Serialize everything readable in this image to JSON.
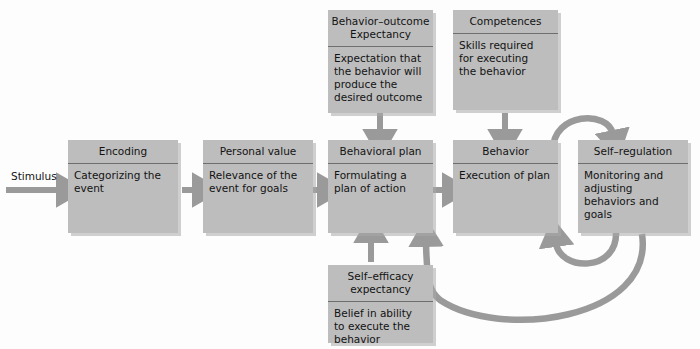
{
  "diagram": {
    "title_text": "Social cognitive process model",
    "colors": {
      "box_fill": "#bdbdbd",
      "box_divider": "#6e6e6e",
      "arrow": "#9a9a9a",
      "text": "#131313",
      "background": "#fdfdfd"
    },
    "entry_label": "Stimulus",
    "boxes": [
      {
        "id": "encoding",
        "head": "Encoding",
        "body": "Categorizing the\nevent"
      },
      {
        "id": "personal-value",
        "head": "Personal value",
        "body": "Relevance of  the\nevent for goals"
      },
      {
        "id": "behavioral-plan",
        "head": "Behavioral plan",
        "body": "Formulating a\nplan of action"
      },
      {
        "id": "behavior",
        "head": "Behavior",
        "body": "Execution of plan"
      },
      {
        "id": "self-regulation",
        "head": "Self–regulation",
        "body": "Monitoring and\nadjusting\nbehaviors and\ngoals"
      },
      {
        "id": "behavior-outcome-expectancy",
        "head": "Behavior–outcome\nExpectancy",
        "body": "Expectation that\nthe behavior will\nproduce the\ndesired outcome"
      },
      {
        "id": "competences",
        "head": "Competences",
        "body": "Skills required\nfor executing\nthe behavior"
      },
      {
        "id": "self-efficacy-expectancy",
        "head": "Self–efficacy\nexpectancy",
        "body": "Belief in ability\nto execute the\nbehavior"
      }
    ],
    "connections": [
      {
        "id": "stimulus-to-encoding",
        "kind": "straight-right"
      },
      {
        "id": "encoding-to-personal-value",
        "kind": "straight-right"
      },
      {
        "id": "personal-value-to-behavioral-plan",
        "kind": "straight-right"
      },
      {
        "id": "behavioral-plan-to-behavior",
        "kind": "straight-right"
      },
      {
        "id": "expectancy-to-behavioral-plan",
        "kind": "straight-down"
      },
      {
        "id": "competences-to-behavior",
        "kind": "straight-down"
      },
      {
        "id": "self-efficacy-to-behavioral-plan",
        "kind": "straight-up"
      },
      {
        "id": "behavior-to-self-regulation",
        "kind": "curve-over-top"
      },
      {
        "id": "self-regulation-to-behavior",
        "kind": "curve-under-small"
      },
      {
        "id": "self-regulation-to-behavioral-plan",
        "kind": "curve-under-large"
      }
    ]
  }
}
